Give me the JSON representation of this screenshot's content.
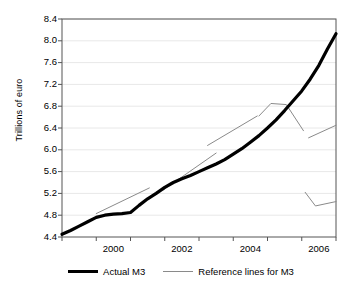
{
  "chart_data": {
    "type": "line",
    "title": "",
    "xlabel": "",
    "ylabel": "Trillions of euro",
    "xlim": [
      1999.0,
      2007.0
    ],
    "ylim": [
      4.4,
      8.4
    ],
    "grid": true,
    "legend_position": "bottom",
    "xticklabels": [
      "2000",
      "2002",
      "2004",
      "2006"
    ],
    "xtickvalues": [
      2000.5,
      2002.5,
      2004.5,
      2006.5
    ],
    "xtick_boundaries": [
      1999,
      2000,
      2001,
      2002,
      2003,
      2004,
      2005,
      2006,
      2007
    ],
    "yticklabels": [
      "4.4",
      "4.8",
      "5.2",
      "5.6",
      "6.0",
      "6.4",
      "6.8",
      "7.2",
      "7.6",
      "8.0",
      "8.4"
    ],
    "ytickvalues": [
      4.4,
      4.8,
      5.2,
      5.6,
      6.0,
      6.4,
      6.8,
      7.2,
      7.6,
      8.0,
      8.4
    ],
    "series": [
      {
        "name": "Actual M3",
        "style": "thick-solid-black",
        "color": "#000000",
        "x": [
          1999.0,
          1999.25,
          1999.5,
          1999.75,
          2000.0,
          2000.25,
          2000.5,
          2000.75,
          2001.0,
          2001.25,
          2001.5,
          2001.75,
          2002.0,
          2002.25,
          2002.5,
          2002.75,
          2003.0,
          2003.25,
          2003.5,
          2003.75,
          2004.0,
          2004.25,
          2004.5,
          2004.75,
          2005.0,
          2005.25,
          2005.5,
          2005.75,
          2006.0,
          2006.25,
          2006.5,
          2006.75,
          2007.0
        ],
        "y": [
          4.45,
          4.52,
          4.6,
          4.68,
          4.76,
          4.8,
          4.82,
          4.83,
          4.85,
          4.98,
          5.1,
          5.2,
          5.31,
          5.4,
          5.47,
          5.53,
          5.6,
          5.67,
          5.74,
          5.82,
          5.92,
          6.02,
          6.14,
          6.26,
          6.4,
          6.55,
          6.72,
          6.9,
          7.08,
          7.3,
          7.55,
          7.85,
          8.13
        ]
      },
      {
        "name": "Reference lines for M3",
        "style": "thin-solid-gray",
        "color": "#8a8a8a",
        "segments": [
          {
            "label": "reference-line-1",
            "x": [
              2000.0,
              2001.55
            ],
            "y": [
              4.83,
              5.3
            ]
          },
          {
            "label": "reference-line-2",
            "x": [
              2001.95,
              2003.5
            ],
            "y": [
              5.26,
              5.94
            ]
          },
          {
            "label": "reference-line-3",
            "x": [
              2003.25,
              2004.7
            ],
            "y": [
              6.08,
              6.62
            ]
          },
          {
            "label": "reference-line-4",
            "x": [
              2004.75,
              2005.1,
              2005.55,
              2006.05
            ],
            "y": [
              6.62,
              6.85,
              6.83,
              6.35
            ]
          },
          {
            "label": "reference-line-5",
            "x": [
              2006.2,
              2007.0
            ],
            "y": [
              6.22,
              6.45
            ]
          },
          {
            "label": "reference-line-6",
            "x": [
              2006.1,
              2006.4,
              2007.0
            ],
            "y": [
              5.22,
              4.97,
              5.05
            ]
          }
        ]
      }
    ],
    "legend": [
      {
        "label": "Actual M3",
        "style": "thick-solid-black"
      },
      {
        "label": "Reference lines for M3",
        "style": "thin-solid-gray"
      }
    ]
  },
  "colors": {
    "actual_line": "#000000",
    "reference_line": "#8a8a8a",
    "axis": "#555555",
    "grid": "#e8e8e8",
    "background": "#ffffff"
  }
}
